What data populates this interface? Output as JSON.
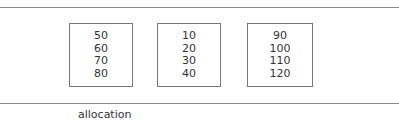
{
  "boxes": [
    {
      "values": [
        "50",
        "60",
        "70",
        "80"
      ]
    },
    {
      "values": [
        "10",
        "20",
        "30",
        "40"
      ]
    },
    {
      "values": [
        "90",
        "100",
        "110",
        "120"
      ]
    }
  ],
  "caption": "allocation"
}
